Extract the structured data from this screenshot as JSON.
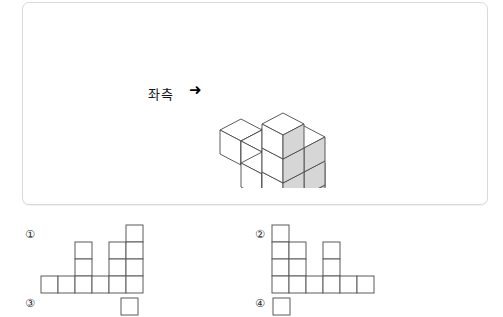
{
  "figure": {
    "direction_label": "좌측",
    "arrow_glyph": "➜",
    "cube_colors": {
      "top_face": "#ffffff",
      "left_face": "#ffffff",
      "right_face": "#d6d6d6",
      "edge": "#4a4a4a"
    },
    "cubes": [
      {
        "x": 0,
        "y": 0,
        "z": 0
      },
      {
        "x": 1,
        "y": 0,
        "z": 0
      },
      {
        "x": 2,
        "y": 0,
        "z": 0
      },
      {
        "x": 2,
        "y": 0,
        "z": 1
      },
      {
        "x": 3,
        "y": 0,
        "z": 0
      },
      {
        "x": 2,
        "y": 1,
        "z": 0
      },
      {
        "x": 3,
        "y": 1,
        "z": 0
      },
      {
        "x": 3,
        "y": 1,
        "z": 1
      },
      {
        "x": 4,
        "y": 1,
        "z": 0
      },
      {
        "x": 4,
        "y": 1,
        "z": 1
      },
      {
        "x": 4,
        "y": 1,
        "z": 2
      },
      {
        "x": 4,
        "y": 2,
        "z": 0
      },
      {
        "x": 4,
        "y": 2,
        "z": 1
      },
      {
        "x": 4,
        "y": 2,
        "z": 2
      },
      {
        "x": 4,
        "y": 2,
        "z": 3
      }
    ]
  },
  "options": [
    {
      "number": "①",
      "columns": 6,
      "rows": 4,
      "heights": [
        1,
        1,
        3,
        1,
        3,
        4
      ],
      "filled": [
        [
          0,
          0,
          0,
          0,
          0,
          1
        ],
        [
          0,
          0,
          1,
          0,
          1,
          1
        ],
        [
          0,
          0,
          1,
          0,
          1,
          1
        ],
        [
          1,
          1,
          1,
          1,
          1,
          1
        ]
      ]
    },
    {
      "number": "②",
      "columns": 6,
      "rows": 4,
      "heights": [
        4,
        3,
        1,
        3,
        1,
        1
      ],
      "filled": [
        [
          1,
          0,
          0,
          0,
          0,
          0
        ],
        [
          1,
          1,
          0,
          1,
          0,
          0
        ],
        [
          1,
          1,
          0,
          1,
          0,
          0
        ],
        [
          1,
          1,
          1,
          1,
          1,
          1
        ]
      ]
    },
    {
      "number": "③",
      "columns": 1,
      "rows": 1,
      "heights": [
        1
      ],
      "filled": [
        [
          1
        ]
      ]
    },
    {
      "number": "④",
      "columns": 1,
      "rows": 1,
      "heights": [
        1
      ],
      "filled": [
        [
          1
        ]
      ]
    }
  ]
}
